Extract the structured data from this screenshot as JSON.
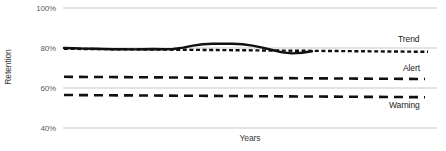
{
  "chart_data": {
    "type": "line",
    "title": "",
    "xlabel": "Years",
    "ylabel": "Retention",
    "ylim": [
      40,
      100
    ],
    "yticks": [
      100,
      80,
      60,
      40
    ],
    "ytick_labels": [
      "100%",
      "80%",
      "60%",
      "40%"
    ],
    "xticks": [],
    "xtick_labels": [],
    "grid": true,
    "legend_position": "right-inline",
    "series": [
      {
        "name": "Retention",
        "style": "solid",
        "color": "#111111",
        "x": [
          0,
          4,
          8,
          12,
          16,
          20,
          24,
          28,
          32,
          36,
          40,
          44,
          48,
          52,
          56,
          60,
          64,
          68,
          72,
          76,
          80,
          84,
          88,
          92,
          96,
          100
        ],
        "values": [
          80.0,
          79.9,
          79.7,
          79.6,
          79.5,
          79.4,
          79.4,
          79.3,
          79.4,
          79.5,
          79.4,
          79.5,
          80.2,
          81.2,
          81.9,
          82.1,
          82.1,
          82.1,
          81.9,
          81.2,
          80.2,
          79.0,
          77.8,
          77.3,
          77.6,
          78.4
        ]
      },
      {
        "name": "Trend",
        "style": "dashed-fine",
        "color": "#111111",
        "x": [
          0,
          100
        ],
        "values": [
          79.6,
          78.1
        ]
      },
      {
        "name": "Alert",
        "style": "dashed-heavy",
        "color": "#111111",
        "x": [
          0,
          100
        ],
        "values": [
          65.6,
          64.5
        ]
      },
      {
        "name": "Warning",
        "style": "dashed-heavy",
        "color": "#111111",
        "x": [
          0,
          100
        ],
        "values": [
          56.5,
          55.4
        ]
      }
    ],
    "annotations": [
      {
        "text": "Trend",
        "series": "Trend",
        "placement": "above-right"
      },
      {
        "text": "Alert",
        "series": "Alert",
        "placement": "above-right"
      },
      {
        "text": "Warning",
        "series": "Warning",
        "placement": "below-right"
      }
    ]
  },
  "axes": {
    "y_title": "Retention",
    "x_title": "Years",
    "y_tick_0": "100%",
    "y_tick_1": "80%",
    "y_tick_2": "60%",
    "y_tick_3": "40%"
  },
  "labels": {
    "trend": "Trend",
    "alert": "Alert",
    "warning": "Warning"
  },
  "colors": {
    "line": "#111111",
    "grid": "#c8c8c8",
    "tick_text": "#5c5c5c",
    "background": "#ffffff"
  }
}
